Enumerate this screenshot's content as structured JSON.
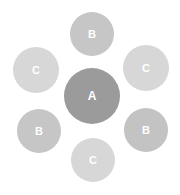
{
  "diagram": {
    "type": "radial-cluster",
    "center": {
      "label": "A",
      "cx": 92,
      "cy": 96,
      "r": 28,
      "color": "#9b9b9b"
    },
    "satellites": [
      {
        "label": "B",
        "position": "top",
        "cx": 92,
        "cy": 34,
        "r": 22,
        "color": "#c6c6c6"
      },
      {
        "label": "C",
        "position": "upper-right",
        "cx": 146,
        "cy": 68,
        "r": 23,
        "color": "#d7d7d7"
      },
      {
        "label": "B",
        "position": "lower-right",
        "cx": 146,
        "cy": 130,
        "r": 22,
        "color": "#c3c3c3"
      },
      {
        "label": "C",
        "position": "bottom",
        "cx": 93,
        "cy": 160,
        "r": 22,
        "color": "#d7d7d7"
      },
      {
        "label": "B",
        "position": "lower-left",
        "cx": 39,
        "cy": 131,
        "r": 22,
        "color": "#c6c6c6"
      },
      {
        "label": "C",
        "position": "upper-left",
        "cx": 36,
        "cy": 70,
        "r": 23,
        "color": "#d7d7d7"
      }
    ]
  }
}
